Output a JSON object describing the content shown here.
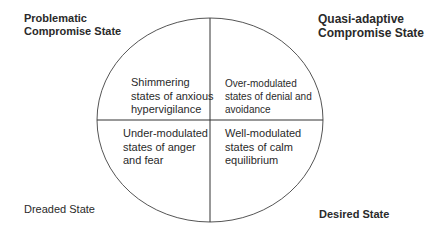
{
  "diagram": {
    "corners": {
      "top_left": {
        "line1": "Problematic",
        "line2": "Compromise State"
      },
      "top_right": {
        "line1": "Quasi-adaptive",
        "line2": "Compromise State"
      },
      "bottom_left": {
        "text": "Dreaded State"
      },
      "bottom_right": {
        "text": "Desired State"
      }
    },
    "quadrants": {
      "top_left": {
        "line1": "Shimmering",
        "line2": "states of anxious",
        "line3": "hypervigilance"
      },
      "top_right": {
        "line1": "Over-modulated",
        "line2": "states of denial and",
        "line3": "avoidance"
      },
      "bottom_left": {
        "line1": "Under-modulated",
        "line2": "states of anger",
        "line3": "and fear"
      },
      "bottom_right": {
        "line1": "Well-modulated",
        "line2": "states of calm",
        "line3": "equilibrium"
      }
    },
    "colors": {
      "stroke": "#444444",
      "text": "#2a2a2a"
    }
  }
}
